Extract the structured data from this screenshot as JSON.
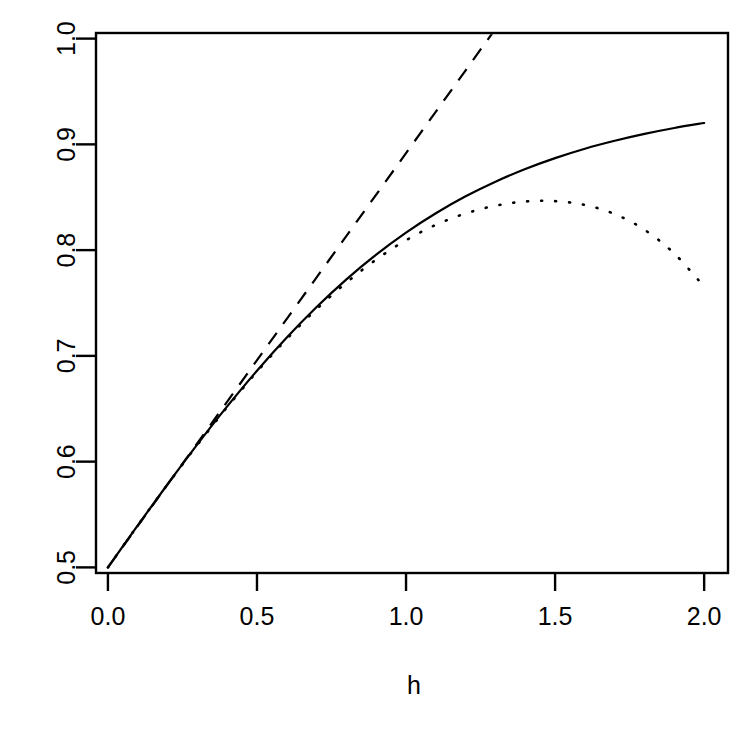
{
  "figure": {
    "background": "#ffffff",
    "foreground": "#000000",
    "panel": {
      "left": 116,
      "right": 710,
      "top": 49,
      "bottom": 552,
      "box_left": 96,
      "box_right": 728,
      "box_top": 33,
      "box_bottom": 573
    }
  },
  "axes": {
    "x_title": "h",
    "y_title": "",
    "x_ticks": [
      "0.0",
      "0.5",
      "1.0",
      "1.5",
      "2.0"
    ],
    "y_ticks": [
      "0.5",
      "0.6",
      "0.7",
      "0.8",
      "0.9",
      "1.0"
    ]
  },
  "chart_data": {
    "type": "line",
    "title": "",
    "xlabel": "h",
    "ylabel": "",
    "xlim": [
      -0.04,
      2.08
    ],
    "ylim": [
      0.4947,
      1.0053
    ],
    "grid": false,
    "legend": "none",
    "box": true,
    "x_tick_values": [
      0.0,
      0.5,
      1.0,
      1.5,
      2.0
    ],
    "y_tick_values": [
      0.5,
      0.6,
      0.7,
      0.8,
      0.9,
      1.0
    ],
    "series": [
      {
        "name": "exact",
        "style": "solid",
        "color": "#000000",
        "linewidth": 2.2,
        "x": [
          0.0,
          0.1,
          0.2,
          0.3,
          0.4,
          0.5,
          0.6,
          0.7,
          0.8,
          0.9,
          1.0,
          1.1,
          1.2,
          1.3,
          1.4,
          1.5,
          1.6,
          1.7,
          1.8,
          1.9,
          2.0
        ],
        "y": [
          0.5,
          0.5398,
          0.5786,
          0.6163,
          0.6522,
          0.686,
          0.7174,
          0.7462,
          0.7724,
          0.7958,
          0.8166,
          0.8349,
          0.8509,
          0.8647,
          0.8767,
          0.887,
          0.8959,
          0.9034,
          0.9099,
          0.9155,
          0.9202
        ]
      },
      {
        "name": "linear-approximation",
        "style": "dashed",
        "color": "#000000",
        "linewidth": 2.2,
        "dasharray": "14 11",
        "x": [
          0.0,
          1.29
        ],
        "y": [
          0.5,
          1.0053
        ],
        "slope": 0.3917,
        "intercept": 0.5
      },
      {
        "name": "quadratic-approximation",
        "style": "dotted",
        "color": "#000000",
        "linewidth": 2.6,
        "dotarray": "1 13",
        "x": [
          0.0,
          0.1,
          0.2,
          0.3,
          0.4,
          0.5,
          0.6,
          0.7,
          0.8,
          0.9,
          1.0,
          1.1,
          1.2,
          1.3,
          1.4,
          1.5,
          1.6,
          1.7,
          1.8,
          1.9,
          2.0
        ],
        "y": [
          0.5,
          0.5397,
          0.5784,
          0.6158,
          0.6515,
          0.685,
          0.716,
          0.7442,
          0.7693,
          0.7911,
          0.8094,
          0.8239,
          0.8347,
          0.842,
          0.846,
          0.8463,
          0.8427,
          0.8341,
          0.8192,
          0.7967,
          0.7655
        ]
      }
    ]
  }
}
